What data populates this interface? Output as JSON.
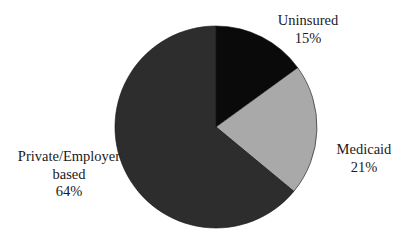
{
  "chart_data": {
    "type": "pie",
    "title": "",
    "categories": [
      "Uninsured",
      "Medicaid",
      "Private/Employer based"
    ],
    "values": [
      15,
      21,
      64
    ],
    "unit": "%",
    "start_angle": "12 o'clock",
    "direction": "clockwise",
    "colors": [
      "#0a0a0a",
      "#a9a9a9",
      "#2d2d2d"
    ],
    "slices": [
      {
        "label": "Uninsured",
        "label_lines": [
          "Uninsured"
        ],
        "value": 15,
        "value_text": "15%",
        "color": "#0a0a0a"
      },
      {
        "label": "Medicaid",
        "label_lines": [
          "Medicaid"
        ],
        "value": 21,
        "value_text": "21%",
        "color": "#a9a9a9"
      },
      {
        "label": "Private/Employer based",
        "label_lines": [
          "Private/Employer",
          "based"
        ],
        "value": 64,
        "value_text": "64%",
        "color": "#2d2d2d"
      }
    ],
    "legend": "none (direct labels)"
  }
}
